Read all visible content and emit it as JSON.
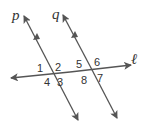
{
  "diagram": {
    "type": "parallel-lines-cut-by-transversal",
    "lines": {
      "p": {
        "label": "p",
        "x1": 24,
        "y1": 16,
        "x2": 78,
        "y2": 120
      },
      "q": {
        "label": "q",
        "x1": 63,
        "y1": 15,
        "x2": 117,
        "y2": 118
      },
      "l": {
        "label": "ℓ",
        "x1": 11,
        "y1": 78,
        "x2": 131,
        "y2": 65
      }
    },
    "line_color": "#555555",
    "angle_labels": [
      "1",
      "2",
      "3",
      "4",
      "5",
      "6",
      "7",
      "8"
    ]
  }
}
